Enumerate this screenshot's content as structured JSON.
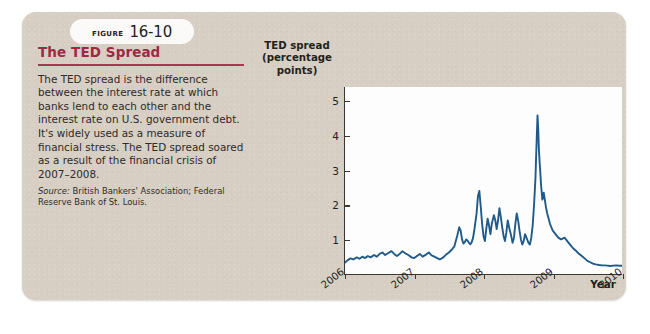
{
  "figure": {
    "badge_word": "Figure",
    "badge_number": "16-10",
    "title": "The TED Spread",
    "body": "The TED spread is the difference between the interest rate at which banks lend to each other and the interest rate on U.S. government debt. It's widely used as a measure of financial stress. The TED spread soared as a result of the financial crisis of 2007–2008.",
    "source_label": "Source:",
    "source_text": " British Bankers' Association; Federal Reserve Bank of St. Louis."
  },
  "colors": {
    "card_background": "#d8cfc4",
    "title_red": "#9f2943",
    "rule_red": "#a8384f",
    "series_blue": "#1f5a8a",
    "axis_black": "#3b3733",
    "plot_background": "#fdfdfd"
  },
  "chart_data": {
    "type": "line",
    "title": "",
    "xlabel": "Year",
    "ylabel": "TED spread (percentage points)",
    "ylabel_lines": [
      "TED spread",
      "(percentage",
      "points)"
    ],
    "xlim": [
      2006,
      2010
    ],
    "ylim": [
      0,
      5.4
    ],
    "grid": false,
    "legend": null,
    "yticks": [
      1,
      2,
      3,
      4,
      5
    ],
    "ytick_labels": [
      "1",
      "2",
      "3",
      "4",
      "5"
    ],
    "xticks": [
      2006,
      2007,
      2008,
      2009,
      2010
    ],
    "xtick_labels": [
      "2006",
      "2007",
      "2008",
      "2009",
      "2010"
    ],
    "series": [
      {
        "name": "TED spread",
        "x": [
          2006.0,
          2006.04,
          2006.08,
          2006.12,
          2006.17,
          2006.21,
          2006.25,
          2006.29,
          2006.33,
          2006.37,
          2006.42,
          2006.46,
          2006.5,
          2006.54,
          2006.58,
          2006.62,
          2006.67,
          2006.71,
          2006.75,
          2006.79,
          2006.83,
          2006.87,
          2006.92,
          2006.96,
          2007.0,
          2007.04,
          2007.08,
          2007.12,
          2007.17,
          2007.21,
          2007.25,
          2007.29,
          2007.33,
          2007.37,
          2007.42,
          2007.46,
          2007.5,
          2007.54,
          2007.58,
          2007.6,
          2007.62,
          2007.65,
          2007.67,
          2007.69,
          2007.71,
          2007.73,
          2007.75,
          2007.77,
          2007.79,
          2007.81,
          2007.83,
          2007.85,
          2007.87,
          2007.9,
          2007.92,
          2007.94,
          2007.96,
          2007.98,
          2008.0,
          2008.02,
          2008.04,
          2008.06,
          2008.08,
          2008.1,
          2008.12,
          2008.15,
          2008.17,
          2008.19,
          2008.21,
          2008.23,
          2008.25,
          2008.27,
          2008.29,
          2008.31,
          2008.33,
          2008.35,
          2008.37,
          2008.4,
          2008.42,
          2008.44,
          2008.46,
          2008.48,
          2008.5,
          2008.52,
          2008.54,
          2008.56,
          2008.58,
          2008.6,
          2008.62,
          2008.65,
          2008.67,
          2008.69,
          2008.71,
          2008.73,
          2008.75,
          2008.76,
          2008.77,
          2008.78,
          2008.79,
          2008.8,
          2008.81,
          2008.82,
          2008.83,
          2008.85,
          2008.87,
          2008.9,
          2008.92,
          2008.94,
          2008.96,
          2008.98,
          2009.0,
          2009.04,
          2009.08,
          2009.12,
          2009.17,
          2009.21,
          2009.25,
          2009.29,
          2009.33,
          2009.37,
          2009.42,
          2009.46,
          2009.5,
          2009.54,
          2009.58,
          2009.62,
          2009.67,
          2009.71,
          2009.75,
          2009.79,
          2009.83,
          2009.87,
          2009.92,
          2009.96,
          2010.0
        ],
        "y": [
          0.33,
          0.4,
          0.45,
          0.42,
          0.48,
          0.44,
          0.5,
          0.46,
          0.52,
          0.48,
          0.55,
          0.5,
          0.58,
          0.62,
          0.55,
          0.6,
          0.66,
          0.58,
          0.52,
          0.58,
          0.66,
          0.6,
          0.54,
          0.48,
          0.46,
          0.52,
          0.58,
          0.5,
          0.56,
          0.62,
          0.54,
          0.5,
          0.46,
          0.42,
          0.48,
          0.56,
          0.62,
          0.7,
          0.8,
          0.95,
          1.1,
          1.35,
          1.25,
          1.0,
          0.88,
          0.92,
          1.0,
          0.96,
          0.9,
          0.86,
          0.92,
          1.05,
          1.3,
          1.75,
          2.25,
          2.4,
          1.95,
          1.45,
          1.1,
          0.95,
          1.3,
          1.6,
          1.4,
          1.15,
          1.45,
          1.7,
          1.55,
          1.3,
          1.55,
          1.9,
          1.65,
          1.35,
          1.1,
          0.95,
          1.2,
          1.55,
          1.35,
          1.1,
          0.9,
          1.05,
          1.45,
          1.75,
          1.55,
          1.25,
          1.0,
          0.85,
          0.95,
          1.15,
          1.05,
          0.9,
          0.85,
          1.05,
          1.4,
          2.0,
          2.75,
          3.4,
          4.0,
          4.58,
          4.2,
          3.6,
          3.25,
          2.95,
          2.6,
          2.15,
          2.35,
          1.95,
          1.75,
          1.6,
          1.45,
          1.35,
          1.25,
          1.15,
          1.05,
          1.0,
          1.05,
          0.95,
          0.85,
          0.75,
          0.68,
          0.6,
          0.52,
          0.45,
          0.38,
          0.34,
          0.3,
          0.28,
          0.26,
          0.25,
          0.25,
          0.24,
          0.23,
          0.24,
          0.25,
          0.24,
          0.24
        ]
      }
    ]
  }
}
